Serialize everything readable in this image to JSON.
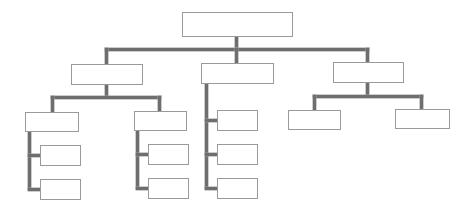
{
  "diagram": {
    "type": "org-chart",
    "line_color": "#6e6e6e",
    "box_border_color": "#9a9a9a",
    "background": "#ffffff",
    "nodes": [
      {
        "id": "root",
        "label": "",
        "x": 182,
        "y": 12,
        "w": 111,
        "h": 25
      },
      {
        "id": "l1-left",
        "label": "",
        "x": 71,
        "y": 64,
        "w": 72,
        "h": 21
      },
      {
        "id": "l1-middle",
        "label": "",
        "x": 201,
        "y": 63,
        "w": 73,
        "h": 21
      },
      {
        "id": "l1-right",
        "label": "",
        "x": 333,
        "y": 62,
        "w": 71,
        "h": 21
      },
      {
        "id": "l2-left-a",
        "label": "",
        "x": 25,
        "y": 112,
        "w": 54,
        "h": 20
      },
      {
        "id": "l2-left-b",
        "label": "",
        "x": 134,
        "y": 111,
        "w": 53,
        "h": 20
      },
      {
        "id": "l2-middle-1",
        "label": "",
        "x": 217,
        "y": 110,
        "w": 41,
        "h": 21
      },
      {
        "id": "l2-middle-2",
        "label": "",
        "x": 217,
        "y": 144,
        "w": 41,
        "h": 21
      },
      {
        "id": "l2-middle-3",
        "label": "",
        "x": 217,
        "y": 178,
        "w": 41,
        "h": 21
      },
      {
        "id": "l2-right-a",
        "label": "",
        "x": 288,
        "y": 110,
        "w": 53,
        "h": 20
      },
      {
        "id": "l2-right-b",
        "label": "",
        "x": 395,
        "y": 109,
        "w": 55,
        "h": 20
      },
      {
        "id": "l3-left-a-1",
        "label": "",
        "x": 40,
        "y": 145,
        "w": 41,
        "h": 21
      },
      {
        "id": "l3-left-a-2",
        "label": "",
        "x": 40,
        "y": 179,
        "w": 41,
        "h": 21
      },
      {
        "id": "l3-left-b-1",
        "label": "",
        "x": 148,
        "y": 144,
        "w": 41,
        "h": 21
      },
      {
        "id": "l3-left-b-2",
        "label": "",
        "x": 148,
        "y": 178,
        "w": 41,
        "h": 21
      }
    ],
    "connectors": [
      {
        "x": 235,
        "y": 37,
        "w": 3,
        "h": 14
      },
      {
        "x": 105,
        "y": 48,
        "w": 264,
        "h": 3
      },
      {
        "x": 105,
        "y": 48,
        "w": 3,
        "h": 16
      },
      {
        "x": 235,
        "y": 48,
        "w": 3,
        "h": 15
      },
      {
        "x": 366,
        "y": 48,
        "w": 3,
        "h": 14
      },
      {
        "x": 105,
        "y": 85,
        "w": 3,
        "h": 12
      },
      {
        "x": 51,
        "y": 96,
        "w": 110,
        "h": 3
      },
      {
        "x": 51,
        "y": 96,
        "w": 3,
        "h": 16
      },
      {
        "x": 158,
        "y": 96,
        "w": 3,
        "h": 15
      },
      {
        "x": 28,
        "y": 132,
        "w": 3,
        "h": 58
      },
      {
        "x": 28,
        "y": 154,
        "w": 12,
        "h": 3
      },
      {
        "x": 28,
        "y": 188,
        "w": 12,
        "h": 3
      },
      {
        "x": 136,
        "y": 131,
        "w": 3,
        "h": 58
      },
      {
        "x": 136,
        "y": 153,
        "w": 12,
        "h": 3
      },
      {
        "x": 136,
        "y": 187,
        "w": 12,
        "h": 3
      },
      {
        "x": 205,
        "y": 84,
        "w": 3,
        "h": 105
      },
      {
        "x": 205,
        "y": 119,
        "w": 12,
        "h": 3
      },
      {
        "x": 205,
        "y": 153,
        "w": 12,
        "h": 3
      },
      {
        "x": 205,
        "y": 187,
        "w": 12,
        "h": 3
      },
      {
        "x": 366,
        "y": 83,
        "w": 3,
        "h": 13
      },
      {
        "x": 313,
        "y": 95,
        "w": 110,
        "h": 3
      },
      {
        "x": 313,
        "y": 95,
        "w": 3,
        "h": 15
      },
      {
        "x": 420,
        "y": 95,
        "w": 3,
        "h": 14
      }
    ]
  }
}
